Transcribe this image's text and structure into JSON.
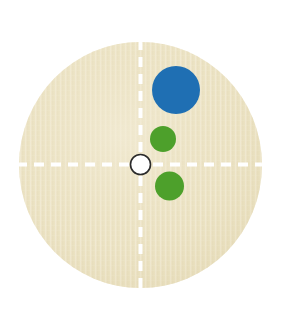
{
  "figure": {
    "type": "petri-dish-colony-diagram",
    "canvas": {
      "width": 293,
      "height": 313,
      "background": "#ffffff"
    }
  },
  "plate": {
    "label": "agar-plate",
    "center_x": 140.5,
    "center_y": 165,
    "radius_x": 121.5,
    "radius_y": 123,
    "fill": "#ece3c4",
    "fill_light": "#f3ecd6",
    "fill_dark": "#e2d7b2",
    "texture": "vertical-woven-streaks"
  },
  "axes": {
    "label": "quadrant-guides",
    "color": "#ffffff",
    "stroke_width": 4,
    "dash": "10 7",
    "vertical": {
      "x": 140.5,
      "y1": 42,
      "y2": 288
    },
    "horizontal": {
      "y": 164.5,
      "x1": 19,
      "x2": 262
    }
  },
  "origin_marker": {
    "label": "center-origin-marker",
    "cx": 140.5,
    "cy": 164.5,
    "r": 10,
    "fill": "#ffffff",
    "stroke": "#2b2b2b",
    "stroke_width": 1.6
  },
  "colonies": [
    {
      "id": "colony-blue-large",
      "name": "large-blue-colony",
      "cx": 176,
      "cy": 90,
      "r": 24,
      "color": "#1f6fb3",
      "quadrant": "upper-right"
    },
    {
      "id": "colony-green-upper",
      "name": "small-green-colony-upper",
      "cx": 163,
      "cy": 139,
      "r": 13,
      "color": "#4da02b",
      "quadrant": "upper-right"
    },
    {
      "id": "colony-green-lower",
      "name": "small-green-colony-lower",
      "cx": 169.5,
      "cy": 186,
      "r": 14.5,
      "color": "#4da02b",
      "quadrant": "lower-right"
    }
  ],
  "palette": {
    "blue": "#1f6fb3",
    "green": "#4da02b",
    "agar_beige": "#ece3c4",
    "guide_white": "#ffffff",
    "marker_outline": "#2b2b2b"
  }
}
